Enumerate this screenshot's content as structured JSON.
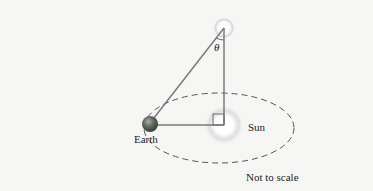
{
  "diagram": {
    "type": "stellar-parallax",
    "labels": {
      "theta": "θ",
      "earth": "Earth",
      "sun": "Sun",
      "note": "Not to scale"
    },
    "colors": {
      "background": "#f6f6f5",
      "lines": "#7a7a7a",
      "orbit": "#555555",
      "earth": "#5c6a5c",
      "text": "#222222"
    }
  }
}
